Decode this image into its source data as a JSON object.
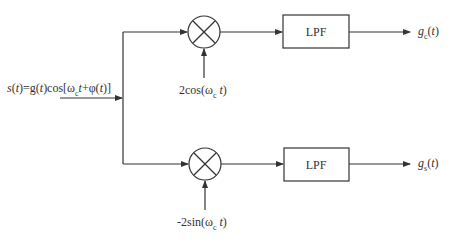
{
  "diagram": {
    "type": "block-diagram",
    "title": "",
    "input": {
      "label_parts": [
        "s(t)=g(t)cos[ω",
        "c",
        "t+φ(t)]"
      ],
      "label_full": "s(t)=g(t)cos[ω_c t+φ(t)]"
    },
    "branches": [
      {
        "id": "in-phase",
        "mixer_symbol": "×",
        "mixer_input_label_parts": [
          "2cos(ω",
          "c",
          " t)"
        ],
        "mixer_input_label_full": "2cos(ω_c t)",
        "filter_label": "LPF",
        "output_label_parts": [
          "g",
          "c",
          "(t)"
        ],
        "output_label_full": "g_c(t)"
      },
      {
        "id": "quadrature",
        "mixer_symbol": "×",
        "mixer_input_label_parts": [
          "-2sin(ω",
          "c",
          " t)"
        ],
        "mixer_input_label_full": "-2sin(ω_c t)",
        "filter_label": "LPF",
        "output_label_parts": [
          "g",
          "s",
          "(t)"
        ],
        "output_label_full": "g_s(t)"
      }
    ],
    "colors": {
      "line": "#333333",
      "background": "#ffffff"
    }
  }
}
